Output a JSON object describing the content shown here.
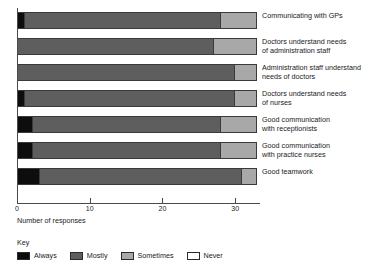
{
  "chart_data": {
    "type": "bar",
    "subtype": "horizontal-stacked",
    "title": "",
    "xlabel": "Number of responses",
    "ylabel": "",
    "xlim": [
      0,
      33
    ],
    "xticks": [
      0,
      10,
      20,
      30
    ],
    "xtick_labels": [
      "0",
      "10",
      "20",
      "30"
    ],
    "grid": false,
    "legend_position": "bottom-left",
    "legend_title": "Key",
    "categories": [
      "Communicating with GPs",
      "Doctors understand needs\nof administration staff",
      "Administration staff understand\nneeds of doctors",
      "Doctors understand needs\nof nurses",
      "Good communication\nwith receptionists",
      "Good communication\nwith practice nurses",
      "Good teamwork"
    ],
    "series": [
      {
        "name": "Always",
        "color": "#0d0d0d",
        "values": [
          1,
          0,
          0,
          1,
          2,
          2,
          3
        ]
      },
      {
        "name": "Mostly",
        "color": "#5e5e5e",
        "values": [
          27,
          27,
          30,
          29,
          26,
          26,
          28
        ]
      },
      {
        "name": "Sometimes",
        "color": "#a8a8a8",
        "values": [
          5,
          6,
          3,
          3,
          5,
          5,
          2
        ]
      },
      {
        "name": "Never",
        "color": "#ffffff",
        "values": [
          0,
          0,
          0,
          0,
          0,
          0,
          0
        ]
      }
    ]
  },
  "axis": {
    "x_title": "Number of responses",
    "ticks": [
      "0",
      "10",
      "20",
      "30"
    ]
  },
  "key": {
    "title": "Key",
    "items": [
      {
        "label": "Always",
        "color": "#0d0d0d"
      },
      {
        "label": "Mostly",
        "color": "#5e5e5e"
      },
      {
        "label": "Sometimes",
        "color": "#a8a8a8"
      },
      {
        "label": "Never",
        "color": "#ffffff"
      }
    ]
  }
}
